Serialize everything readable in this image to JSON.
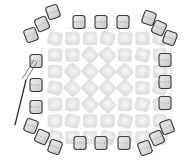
{
  "diagram": {
    "type": "beadwork-stitch-illustration",
    "colors": {
      "background": "#ffffff",
      "fill_bead": "#e4e4e4",
      "fill_bead_highlight": "#f6f6f6",
      "edge_bead_fill": "#dcdcdc",
      "edge_bead_stroke": "#3a3a3a",
      "thread": "#555555",
      "needle": "#222222"
    },
    "edge_beads": [
      {
        "x": 53,
        "y": 12,
        "r": -20
      },
      {
        "x": 42,
        "y": 24,
        "r": -25
      },
      {
        "x": 31,
        "y": 35,
        "r": -20
      },
      {
        "x": 79,
        "y": 22,
        "r": 0
      },
      {
        "x": 101,
        "y": 22,
        "r": 0
      },
      {
        "x": 123,
        "y": 22,
        "r": 0
      },
      {
        "x": 149,
        "y": 18,
        "r": 20
      },
      {
        "x": 159,
        "y": 28,
        "r": 25
      },
      {
        "x": 170,
        "y": 38,
        "r": 20
      },
      {
        "x": 36,
        "y": 61,
        "r": 0
      },
      {
        "x": 36,
        "y": 85,
        "r": 0
      },
      {
        "x": 36,
        "y": 107,
        "r": 0
      },
      {
        "x": 165,
        "y": 60,
        "r": 0
      },
      {
        "x": 165,
        "y": 82,
        "r": 0
      },
      {
        "x": 165,
        "y": 103,
        "r": 0
      },
      {
        "x": 31,
        "y": 126,
        "r": 20
      },
      {
        "x": 42,
        "y": 137,
        "r": 25
      },
      {
        "x": 55,
        "y": 147,
        "r": 20
      },
      {
        "x": 80,
        "y": 143,
        "r": 0
      },
      {
        "x": 101,
        "y": 143,
        "r": 0
      },
      {
        "x": 124,
        "y": 143,
        "r": 0
      },
      {
        "x": 145,
        "y": 148,
        "r": -20
      },
      {
        "x": 157,
        "y": 138,
        "r": -25
      },
      {
        "x": 167,
        "y": 127,
        "r": -20
      }
    ],
    "needle": {
      "x1": 15,
      "y1": 125,
      "x2": 26,
      "y2": 80
    },
    "thread": [
      {
        "x1": 26,
        "y1": 80,
        "x2": 37,
        "y2": 62
      },
      {
        "x1": 22,
        "y1": 79,
        "x2": 34,
        "y2": 60
      }
    ]
  }
}
